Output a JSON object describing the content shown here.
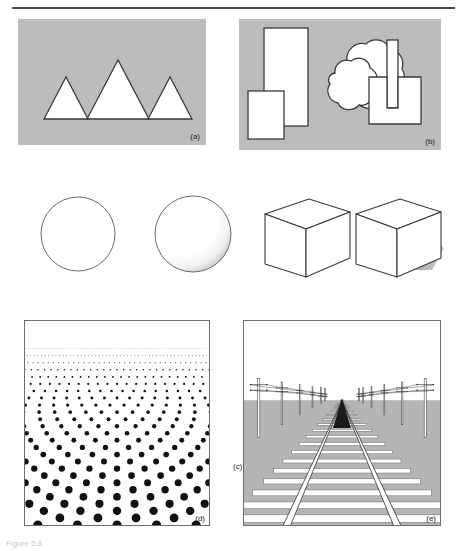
{
  "figure": {
    "title_partial": "Figure 5.8",
    "panels": [
      {
        "id": "a",
        "label": "(a)",
        "name": "relative-size-panel"
      },
      {
        "id": "b",
        "label": "(b)",
        "name": "interposition-panel"
      },
      {
        "id": "c",
        "label": "(c)",
        "name": "shading-and-shadow-panel"
      },
      {
        "id": "d",
        "label": "(d)",
        "name": "texture-gradient-panel"
      },
      {
        "id": "e",
        "label": "(e)",
        "name": "linear-perspective-panel"
      }
    ]
  },
  "colors": {
    "panel_gray": "#bcbcbc",
    "outline": "#3a3a3a",
    "shape_fill": "#ffffff",
    "shadow_gray": "#a8a8a8",
    "ground_gray": "#b5b5b5",
    "rail_white": "#ffffff",
    "rule": "#4a4a4a"
  },
  "panel_a": {
    "label": "(a)",
    "description": "three white outlined triangles of differing size on gray field",
    "shapes": [
      {
        "name": "triangle-small-left",
        "apex_x": 48,
        "base_y": 100,
        "half_width": 22,
        "height": 42
      },
      {
        "name": "triangle-large-center",
        "apex_x": 100,
        "base_y": 100,
        "half_width": 31,
        "height": 59
      },
      {
        "name": "triangle-small-right",
        "apex_x": 152,
        "base_y": 100,
        "half_width": 22,
        "height": 42
      }
    ]
  },
  "panel_b": {
    "label": "(b)",
    "description": "overlapping white shapes showing interposition on gray field",
    "shapes": [
      {
        "name": "tall-rectangle",
        "x": 25,
        "y": 9,
        "w": 44,
        "h": 98
      },
      {
        "name": "small-rectangle-front",
        "x": 9,
        "y": 72,
        "w": 36,
        "h": 48
      },
      {
        "name": "blob-back",
        "name2": "amoeba-upper"
      },
      {
        "name": "blob-front",
        "name2": "amoeba-lower"
      },
      {
        "name": "square-right",
        "x": 130,
        "y": 58,
        "w": 52,
        "h": 47
      },
      {
        "name": "vertical-bar",
        "x": 148,
        "y": 21,
        "w": 11,
        "h": 68
      }
    ]
  },
  "panel_c": {
    "label": "(c)",
    "description": "flat circle, shaded sphere, line-drawn cube, cube with cast shadow",
    "shapes": [
      {
        "name": "flat-circle",
        "cx": 58,
        "cy": 48,
        "r": 37
      },
      {
        "name": "shaded-sphere",
        "cx": 173,
        "cy": 48,
        "r": 38
      },
      {
        "name": "cube-no-shadow",
        "cx": 285,
        "cy": 50
      },
      {
        "name": "cube-with-shadow",
        "cx": 380,
        "cy": 50
      }
    ]
  },
  "panel_d": {
    "label": "(d)",
    "description": "texture gradient: dot field receding to horizon, dots shrink and crowd with distance",
    "rows": 26,
    "columns": 9,
    "max_dot_radius": 4.6,
    "min_dot_radius": 0.25
  },
  "panel_e": {
    "label": "(e)",
    "description": "railway track with telegraph poles converging at a vanishing point on the horizon",
    "horizon_y": 80,
    "vanishing_point_x": 99,
    "sleepers": 22,
    "pole_pairs": 8
  }
}
